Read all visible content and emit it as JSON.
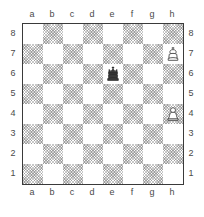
{
  "diagram": {
    "type": "chess-board-diagram",
    "orientation": "white-bottom",
    "board_size": 8,
    "files": [
      "a",
      "b",
      "c",
      "d",
      "e",
      "f",
      "g",
      "h"
    ],
    "ranks": [
      "8",
      "7",
      "6",
      "5",
      "4",
      "3",
      "2",
      "1"
    ],
    "colors": {
      "light_square": "#ffffff",
      "dark_square": "#d9d9d9",
      "border": "#3a3a3a",
      "label_text": "#4a4a4a",
      "white_piece_fill": "#ffffff",
      "white_piece_outline": "#444444",
      "black_piece_fill": "#3a3a3a"
    },
    "coordinate_labels": {
      "top_files": [
        "a",
        "b",
        "c",
        "d",
        "e",
        "f",
        "g",
        "h"
      ],
      "bottom_files": [
        "a",
        "b",
        "c",
        "d",
        "e",
        "f",
        "g",
        "h"
      ],
      "left_ranks": [
        "8",
        "7",
        "6",
        "5",
        "4",
        "3",
        "2",
        "1"
      ],
      "right_ranks": [
        "8",
        "7",
        "6",
        "5",
        "4",
        "3",
        "2",
        "1"
      ]
    },
    "squares": [
      [
        "light",
        "dark",
        "light",
        "dark",
        "light",
        "dark",
        "light",
        "dark"
      ],
      [
        "dark",
        "light",
        "dark",
        "light",
        "dark",
        "light",
        "dark",
        "light"
      ],
      [
        "light",
        "dark",
        "light",
        "dark",
        "light",
        "dark",
        "light",
        "dark"
      ],
      [
        "dark",
        "light",
        "dark",
        "light",
        "dark",
        "light",
        "dark",
        "light"
      ],
      [
        "light",
        "dark",
        "light",
        "dark",
        "light",
        "dark",
        "light",
        "dark"
      ],
      [
        "dark",
        "light",
        "dark",
        "light",
        "dark",
        "light",
        "dark",
        "light"
      ],
      [
        "light",
        "dark",
        "light",
        "dark",
        "light",
        "dark",
        "light",
        "dark"
      ],
      [
        "dark",
        "light",
        "dark",
        "light",
        "dark",
        "light",
        "dark",
        "light"
      ]
    ],
    "pieces": [
      {
        "square": "h7",
        "file": "h",
        "rank": "7",
        "color": "white",
        "type": "king",
        "glyph": "white-king"
      },
      {
        "square": "e6",
        "file": "e",
        "rank": "6",
        "color": "black",
        "type": "king",
        "glyph": "black-king"
      },
      {
        "square": "h4",
        "file": "h",
        "rank": "4",
        "color": "white",
        "type": "pawn",
        "glyph": "white-pawn"
      }
    ],
    "position_fen": "8/7K/4k3/8/7P/8/8/8"
  }
}
